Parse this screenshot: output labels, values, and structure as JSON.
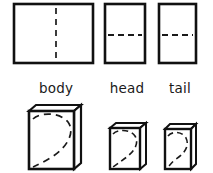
{
  "figure": {
    "background_color": "#ffffff",
    "ink_color": "#1a1a1a",
    "stroke_color": "#111111",
    "fold_line_style": "dashed",
    "labels": [
      {
        "id": "body",
        "text": "body",
        "x": 56,
        "y": 93
      },
      {
        "id": "head",
        "text": "head",
        "x": 127,
        "y": 93
      },
      {
        "id": "tail",
        "text": "tail",
        "x": 180,
        "y": 93
      }
    ],
    "top_row": {
      "caption": "flat sheets with fold lines",
      "panels": [
        {
          "id": "body-sheet",
          "name": "body",
          "x": 14,
          "y": 4,
          "width": 79,
          "height": 59,
          "fold_orientation": "vertical",
          "fold_position": 0.53
        },
        {
          "id": "head-sheet",
          "name": "head",
          "x": 105,
          "y": 4,
          "width": 40,
          "height": 59,
          "fold_orientation": "horizontal",
          "fold_position": 0.53
        },
        {
          "id": "tail-sheet",
          "name": "tail",
          "x": 159,
          "y": 4,
          "width": 37,
          "height": 59,
          "fold_orientation": "horizontal",
          "fold_position": 0.53
        }
      ]
    },
    "bottom_row": {
      "caption": "folded forms with hidden curved edge",
      "panels": [
        {
          "id": "body-folded",
          "name": "body",
          "x": 29,
          "y": 105,
          "width": 45,
          "height": 64,
          "cover_depth": 7,
          "cover_height": 6,
          "curve": "teardrop"
        },
        {
          "id": "head-folded",
          "name": "head",
          "x": 110,
          "y": 123,
          "width": 30,
          "height": 46,
          "cover_depth": 6,
          "cover_height": 5,
          "curve": "teardrop"
        },
        {
          "id": "tail-folded",
          "name": "tail",
          "x": 165,
          "y": 124,
          "width": 26,
          "height": 45,
          "cover_depth": 5,
          "cover_height": 5,
          "curve": "teardrop"
        }
      ]
    }
  }
}
